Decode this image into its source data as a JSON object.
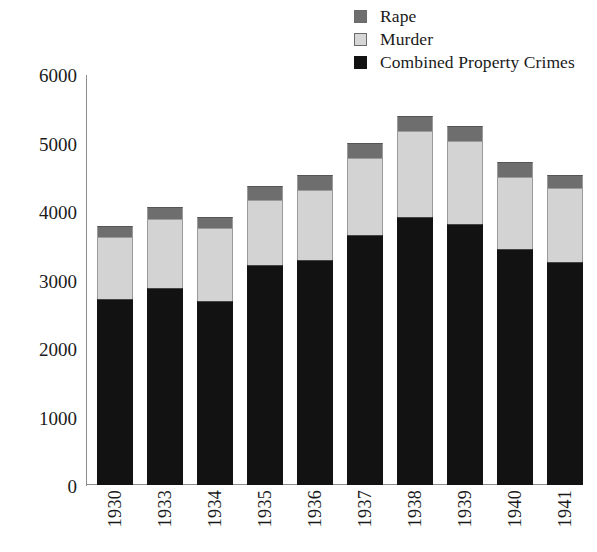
{
  "chart_data": {
    "type": "bar",
    "subtype": "stacked-vertical",
    "title": "",
    "xlabel": "",
    "ylabel": "",
    "ylim": [
      0,
      6000
    ],
    "yticks": [
      0,
      1000,
      2000,
      3000,
      4000,
      5000,
      6000
    ],
    "ytick_labels": [
      "0",
      "1000",
      "2000",
      "3000",
      "4000",
      "5000",
      "6000"
    ],
    "grid": false,
    "legend_position": "top-right",
    "categories": [
      "1930",
      "1933",
      "1934",
      "1935",
      "1936",
      "1937",
      "1938",
      "1939",
      "1940",
      "1941"
    ],
    "series": [
      {
        "name": "Combined Property Crimes",
        "color": "#121212",
        "values": [
          2690,
          2850,
          2670,
          3190,
          3260,
          3630,
          3890,
          3780,
          3420,
          3230
        ]
      },
      {
        "name": "Murder",
        "color": "#d3d3d3",
        "values": [
          900,
          1000,
          1050,
          940,
          1020,
          1110,
          1240,
          1210,
          1050,
          1080
        ]
      },
      {
        "name": "Rape",
        "color": "#6e6e6e",
        "values": [
          160,
          180,
          160,
          210,
          210,
          210,
          220,
          220,
          210,
          190
        ]
      }
    ],
    "totals": [
      3750,
      4030,
      3880,
      4340,
      4490,
      4950,
      5350,
      5210,
      4680,
      4500
    ]
  },
  "legend": {
    "items": [
      {
        "label": "Rape",
        "swatch_color": "#6e6e6e",
        "swatch_name": "legend-swatch-rape"
      },
      {
        "label": "Murder",
        "swatch_color": "#d3d3d3",
        "swatch_name": "legend-swatch-murder"
      },
      {
        "label": "Combined Property Crimes",
        "swatch_color": "#121212",
        "swatch_name": "legend-swatch-property"
      }
    ]
  },
  "axes": {
    "y": {
      "labels": [
        "6000",
        "5000",
        "4000",
        "3000",
        "2000",
        "1000",
        "0"
      ],
      "min": 0,
      "max": 6000
    },
    "x": {
      "labels": [
        "1930",
        "1933",
        "1934",
        "1935",
        "1936",
        "1937",
        "1938",
        "1939",
        "1940",
        "1941"
      ]
    }
  }
}
